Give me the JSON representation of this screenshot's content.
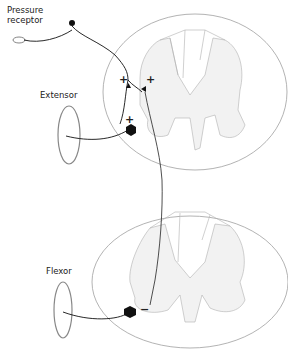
{
  "labels": {
    "receptor_line1": "Pressure",
    "receptor_line2": "receptor",
    "extensor": "Extensor",
    "flexor": "Flexor"
  },
  "synapse_signs": {
    "upper_left": "+",
    "upper_right": "+",
    "extensor_motor": "+",
    "flexor_motor": "−"
  },
  "colors": {
    "neuron": "#111111",
    "cord_outline": "#9a9a9a",
    "gray_matter": "#f1f1f1",
    "muscle": "#8a8a8a"
  }
}
